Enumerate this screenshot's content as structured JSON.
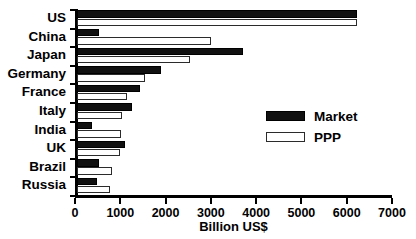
{
  "chart_data": {
    "type": "bar",
    "orientation": "horizontal",
    "title": "",
    "xlabel": "Billion US$",
    "ylabel": "",
    "xlim": [
      0,
      7000
    ],
    "xticks": [
      0,
      1000,
      2000,
      3000,
      4000,
      5000,
      6000,
      7000
    ],
    "xtick_labels": [
      "0",
      "1000",
      "2000",
      "3000",
      "4000",
      "5000",
      "6000",
      "7000"
    ],
    "grid": false,
    "legend_position": "center-right",
    "categories": [
      "US",
      "China",
      "Japan",
      "Germany",
      "France",
      "Italy",
      "India",
      "UK",
      "Brazil",
      "Russia"
    ],
    "series": [
      {
        "name": "Market",
        "color": "#111111",
        "values": [
          6180,
          490,
          3660,
          1850,
          1400,
          1220,
          330,
          1050,
          480,
          450
        ]
      },
      {
        "name": "PPP",
        "color": "#ffffff",
        "values": [
          6180,
          2950,
          2500,
          1500,
          1110,
          1000,
          980,
          950,
          770,
          720
        ]
      }
    ]
  },
  "legend": {
    "items": [
      {
        "label": "Market",
        "swatch": "filled-black-swatch"
      },
      {
        "label": "PPP",
        "swatch": "outlined-white-swatch"
      }
    ]
  }
}
